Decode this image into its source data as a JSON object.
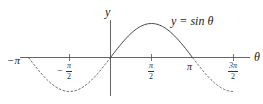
{
  "chart_data": {
    "type": "line",
    "title": "",
    "function_label": "y = sin θ",
    "xlabel": "θ",
    "ylabel": "y",
    "x_ticks": [
      {
        "label": "−π",
        "value": -3.14159
      },
      {
        "label": "−π/2",
        "value": -1.5708
      },
      {
        "label": "π/2",
        "value": 1.5708
      },
      {
        "label": "π",
        "value": 3.14159
      },
      {
        "label": "3π/2",
        "value": 4.71239
      }
    ],
    "xlim": [
      -3.14159,
      4.71239
    ],
    "ylim": [
      -1,
      1
    ],
    "grid": false,
    "legend": "none",
    "series": [
      {
        "name": "y = sin θ (solid)",
        "style": "solid",
        "x": [
          0,
          0.7854,
          1.5708,
          2.3562,
          3.14159
        ],
        "values": [
          0,
          0.7071,
          1,
          0.7071,
          0
        ]
      },
      {
        "name": "y = sin θ (dashed, left)",
        "style": "dashed",
        "x": [
          -3.14159,
          -2.3562,
          -1.5708,
          -0.7854,
          0
        ],
        "values": [
          0,
          -0.7071,
          -1,
          -0.7071,
          0
        ]
      },
      {
        "name": "y = sin θ (dashed, right)",
        "style": "dashed",
        "x": [
          3.14159,
          3.927,
          4.71239
        ],
        "values": [
          0,
          -0.7071,
          -1
        ]
      }
    ]
  },
  "labels": {
    "y_axis": "y",
    "x_axis": "θ",
    "function": "y = sin θ",
    "neg_pi": "−π",
    "pi": "π",
    "neg_half_pi_num": "π",
    "neg_half_pi_den": "2",
    "neg_sign": "−",
    "half_pi_num": "π",
    "half_pi_den": "2",
    "three_half_pi_num": "3π",
    "three_half_pi_den": "2"
  },
  "colors": {
    "axis": "#555555",
    "curve": "#444444"
  }
}
